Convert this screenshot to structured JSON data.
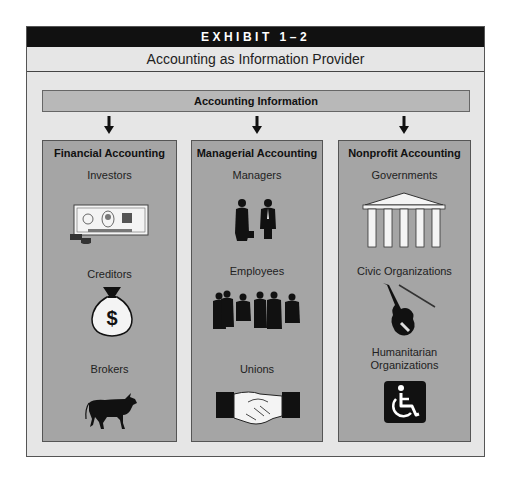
{
  "exhibit": {
    "label": "EXHIBIT 1–2",
    "title": "Accounting as Information Provider"
  },
  "source": {
    "label": "Accounting Information"
  },
  "columns": [
    {
      "title": "Financial Accounting",
      "items": [
        {
          "label": "Investors",
          "icon": "currency-bill-icon"
        },
        {
          "label": "Creditors",
          "icon": "money-bag-icon"
        },
        {
          "label": "Brokers",
          "icon": "bull-icon"
        }
      ]
    },
    {
      "title": "Managerial Accounting",
      "items": [
        {
          "label": "Managers",
          "icon": "two-businesspeople-icon"
        },
        {
          "label": "Employees",
          "icon": "group-of-employees-icon"
        },
        {
          "label": "Unions",
          "icon": "handshake-icon"
        }
      ]
    },
    {
      "title": "Nonprofit Accounting",
      "items": [
        {
          "label": "Governments",
          "icon": "government-building-icon"
        },
        {
          "label": "Civic Organizations",
          "icon": "violin-icon"
        },
        {
          "label": "Humanitarian Organizations",
          "label_lines": [
            "Humanitarian",
            "Organizations"
          ],
          "icon": "wheelchair-accessibility-icon"
        }
      ]
    }
  ],
  "colors": {
    "exhibit_bar": "#111111",
    "frame_bg": "#e6e6e6",
    "info_bar": "#b8b8b8",
    "column_bg": "#a5a5a5"
  }
}
